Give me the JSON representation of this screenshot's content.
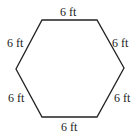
{
  "figure": {
    "shape": "regular hexagon",
    "stroke_color": "#222222",
    "side_labels": {
      "top": "6 ft",
      "upper_left": "6 ft",
      "upper_right": "6 ft",
      "lower_left": "6 ft",
      "lower_right": "6 ft",
      "bottom": "6 ft"
    }
  }
}
